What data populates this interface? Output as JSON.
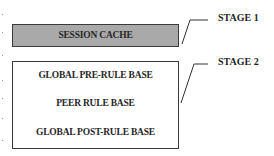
{
  "stages": [
    {
      "label": "STAGE 1",
      "box_fill": "#a9a9a9",
      "items": [
        "SESSION CACHE"
      ]
    },
    {
      "label": "STAGE 2",
      "box_fill": "#ffffff",
      "items": [
        "GLOBAL PRE-RULE BASE",
        "PEER RULE BASE",
        "GLOBAL POST-RULE BASE"
      ]
    }
  ]
}
